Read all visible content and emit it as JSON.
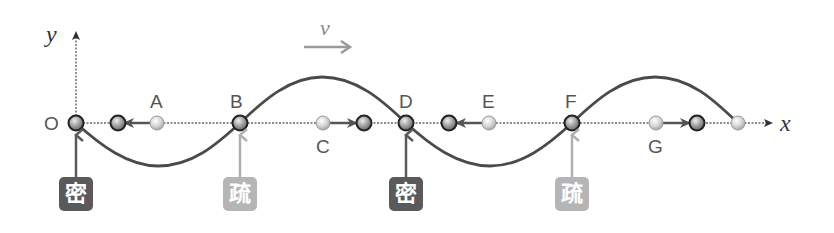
{
  "diagram": {
    "axes": {
      "x_label": "x",
      "y_label": "y",
      "origin_label": "O"
    },
    "velocity": {
      "label": "v",
      "direction": "right"
    },
    "points": [
      {
        "label": "O",
        "x": 76,
        "type": "node"
      },
      {
        "label": "A",
        "x": 157,
        "displacement": "left",
        "displaced_x": 118
      },
      {
        "label": "B",
        "x": 240,
        "type": "node"
      },
      {
        "label": "C",
        "x": 323,
        "displacement": "right",
        "displaced_x": 364
      },
      {
        "label": "D",
        "x": 406,
        "type": "node"
      },
      {
        "label": "E",
        "x": 489,
        "displacement": "left",
        "displaced_x": 449
      },
      {
        "label": "F",
        "x": 572,
        "type": "node"
      },
      {
        "label": "G",
        "x": 656,
        "displacement": "right",
        "displaced_x": 697
      }
    ],
    "tags": [
      {
        "text": "密",
        "meaning": "compression",
        "at": "O"
      },
      {
        "text": "疏",
        "meaning": "rarefaction",
        "at": "B"
      },
      {
        "text": "密",
        "meaning": "compression",
        "at": "D"
      },
      {
        "text": "疏",
        "meaning": "rarefaction",
        "at": "F"
      }
    ],
    "colors": {
      "wave": "#4a4a4a",
      "dense_tag": "#5a5a5a",
      "sparse_tag": "#b5b5b5",
      "velocity_arrow": "#9a9a9a",
      "axis": "#666666"
    }
  }
}
